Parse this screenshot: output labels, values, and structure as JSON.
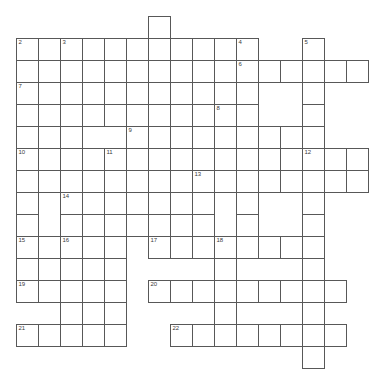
{
  "puzzle": {
    "title": "Crossword Grid",
    "kind": "crossword-grid",
    "geometry": {
      "origin_x": 16,
      "origin_y": 16,
      "cell_size": 22,
      "columns": 17,
      "rows": 17,
      "cell_border_color": "#585858",
      "cell_fill_color": "#ffffff",
      "number_color": "#3a3a3a",
      "background_color": "#ffffff",
      "width": 387,
      "height": 385
    },
    "entries": [
      {
        "number": "1",
        "direction": "down",
        "col": 6,
        "row": 0,
        "length": 1
      },
      {
        "number": "2",
        "direction": "across",
        "col": 0,
        "row": 1,
        "length": 10
      },
      {
        "number": "3",
        "direction": "down",
        "col": 2,
        "row": 1,
        "length": 1
      },
      {
        "number": "4",
        "direction": "down",
        "col": 10,
        "row": 1,
        "length": 1
      },
      {
        "number": "5",
        "direction": "down",
        "col": 13,
        "row": 1,
        "length": 1
      },
      {
        "number": "6",
        "direction": "across",
        "col": 10,
        "row": 2,
        "length": 6
      },
      {
        "number": "7",
        "direction": "across",
        "col": 0,
        "row": 3,
        "length": 9
      },
      {
        "number": "8",
        "direction": "down",
        "col": 9,
        "row": 4,
        "length": 1
      },
      {
        "number": "9",
        "direction": "across",
        "col": 5,
        "row": 5,
        "length": 9
      },
      {
        "number": "10",
        "direction": "across",
        "col": 0,
        "row": 6,
        "length": 17
      },
      {
        "number": "11",
        "direction": "down",
        "col": 4,
        "row": 6,
        "length": 1
      },
      {
        "number": "12",
        "direction": "across",
        "col": 13,
        "row": 6,
        "length": 3
      },
      {
        "number": "13",
        "direction": "across",
        "col": 8,
        "row": 7,
        "length": 9
      },
      {
        "number": "14",
        "direction": "across",
        "col": 2,
        "row": 8,
        "length": 8
      },
      {
        "number": "15",
        "direction": "across",
        "col": 0,
        "row": 10,
        "length": 5
      },
      {
        "number": "16",
        "direction": "down",
        "col": 2,
        "row": 10,
        "length": 1
      },
      {
        "number": "17",
        "direction": "across",
        "col": 6,
        "row": 10,
        "length": 8
      },
      {
        "number": "18",
        "direction": "down",
        "col": 9,
        "row": 10,
        "length": 1
      },
      {
        "number": "19",
        "direction": "across",
        "col": 0,
        "row": 12,
        "length": 5
      },
      {
        "number": "20",
        "direction": "across",
        "col": 6,
        "row": 12,
        "length": 9
      },
      {
        "number": "21",
        "direction": "across",
        "col": 0,
        "row": 14,
        "length": 5
      },
      {
        "number": "22",
        "direction": "across",
        "col": 7,
        "row": 14,
        "length": 8
      }
    ],
    "cells": [
      {
        "col": 6,
        "row": 0
      },
      {
        "col": 0,
        "row": 1,
        "number": "2"
      },
      {
        "col": 1,
        "row": 1
      },
      {
        "col": 2,
        "row": 1,
        "number": "3"
      },
      {
        "col": 3,
        "row": 1
      },
      {
        "col": 4,
        "row": 1
      },
      {
        "col": 5,
        "row": 1
      },
      {
        "col": 6,
        "row": 1
      },
      {
        "col": 7,
        "row": 1
      },
      {
        "col": 8,
        "row": 1
      },
      {
        "col": 9,
        "row": 1
      },
      {
        "col": 10,
        "row": 1,
        "number": "4"
      },
      {
        "col": 13,
        "row": 1,
        "number": "5"
      },
      {
        "col": 0,
        "row": 2
      },
      {
        "col": 1,
        "row": 2
      },
      {
        "col": 2,
        "row": 2
      },
      {
        "col": 3,
        "row": 2
      },
      {
        "col": 4,
        "row": 2
      },
      {
        "col": 5,
        "row": 2
      },
      {
        "col": 6,
        "row": 2
      },
      {
        "col": 7,
        "row": 2
      },
      {
        "col": 8,
        "row": 2
      },
      {
        "col": 9,
        "row": 2
      },
      {
        "col": 10,
        "row": 2,
        "number": "6"
      },
      {
        "col": 11,
        "row": 2
      },
      {
        "col": 12,
        "row": 2
      },
      {
        "col": 13,
        "row": 2
      },
      {
        "col": 14,
        "row": 2
      },
      {
        "col": 15,
        "row": 2
      },
      {
        "col": 0,
        "row": 3,
        "number": "7"
      },
      {
        "col": 1,
        "row": 3
      },
      {
        "col": 2,
        "row": 3
      },
      {
        "col": 3,
        "row": 3
      },
      {
        "col": 4,
        "row": 3
      },
      {
        "col": 5,
        "row": 3
      },
      {
        "col": 6,
        "row": 3
      },
      {
        "col": 7,
        "row": 3
      },
      {
        "col": 8,
        "row": 3
      },
      {
        "col": 10,
        "row": 3
      },
      {
        "col": 13,
        "row": 3
      },
      {
        "col": 0,
        "row": 4
      },
      {
        "col": 1,
        "row": 4
      },
      {
        "col": 2,
        "row": 4
      },
      {
        "col": 3,
        "row": 4
      },
      {
        "col": 4,
        "row": 4
      },
      {
        "col": 5,
        "row": 4
      },
      {
        "col": 6,
        "row": 4
      },
      {
        "col": 7,
        "row": 4
      },
      {
        "col": 8,
        "row": 4
      },
      {
        "col": 9,
        "row": 4,
        "number": "8"
      },
      {
        "col": 10,
        "row": 4
      },
      {
        "col": 13,
        "row": 4
      },
      {
        "col": 0,
        "row": 5
      },
      {
        "col": 1,
        "row": 5
      },
      {
        "col": 2,
        "row": 5
      },
      {
        "col": 5,
        "row": 5,
        "number": "9"
      },
      {
        "col": 6,
        "row": 5
      },
      {
        "col": 7,
        "row": 5
      },
      {
        "col": 8,
        "row": 5
      },
      {
        "col": 9,
        "row": 5
      },
      {
        "col": 10,
        "row": 5
      },
      {
        "col": 11,
        "row": 5
      },
      {
        "col": 12,
        "row": 5
      },
      {
        "col": 13,
        "row": 5
      },
      {
        "col": 0,
        "row": 6,
        "number": "10"
      },
      {
        "col": 1,
        "row": 6
      },
      {
        "col": 2,
        "row": 6
      },
      {
        "col": 3,
        "row": 6
      },
      {
        "col": 4,
        "row": 6,
        "number": "11"
      },
      {
        "col": 5,
        "row": 6
      },
      {
        "col": 6,
        "row": 6
      },
      {
        "col": 7,
        "row": 6
      },
      {
        "col": 8,
        "row": 6
      },
      {
        "col": 9,
        "row": 6
      },
      {
        "col": 10,
        "row": 6
      },
      {
        "col": 11,
        "row": 6
      },
      {
        "col": 12,
        "row": 6
      },
      {
        "col": 13,
        "row": 6,
        "number": "12"
      },
      {
        "col": 14,
        "row": 6
      },
      {
        "col": 15,
        "row": 6
      },
      {
        "col": 0,
        "row": 7
      },
      {
        "col": 1,
        "row": 7
      },
      {
        "col": 2,
        "row": 7
      },
      {
        "col": 3,
        "row": 7
      },
      {
        "col": 4,
        "row": 7
      },
      {
        "col": 6,
        "row": 7
      },
      {
        "col": 8,
        "row": 7,
        "number": "13"
      },
      {
        "col": 9,
        "row": 7
      },
      {
        "col": 10,
        "row": 7
      },
      {
        "col": 11,
        "row": 7
      },
      {
        "col": 12,
        "row": 7
      },
      {
        "col": 13,
        "row": 7
      },
      {
        "col": 14,
        "row": 7
      },
      {
        "col": 15,
        "row": 7
      },
      {
        "col": 0,
        "row": 8
      },
      {
        "col": 2,
        "row": 8,
        "number": "14"
      },
      {
        "col": 3,
        "row": 8
      },
      {
        "col": 4,
        "row": 8
      },
      {
        "col": 5,
        "row": 8
      },
      {
        "col": 6,
        "row": 8
      },
      {
        "col": 7,
        "row": 8
      },
      {
        "col": 8,
        "row": 8
      },
      {
        "col": 10,
        "row": 8
      },
      {
        "col": 13,
        "row": 8
      },
      {
        "col": 0,
        "row": 9
      },
      {
        "col": 2,
        "row": 9
      },
      {
        "col": 3,
        "row": 9
      },
      {
        "col": 4,
        "row": 9
      },
      {
        "col": 5,
        "row": 9
      },
      {
        "col": 6,
        "row": 9
      },
      {
        "col": 7,
        "row": 9
      },
      {
        "col": 8,
        "row": 9
      },
      {
        "col": 10,
        "row": 9
      },
      {
        "col": 13,
        "row": 9
      },
      {
        "col": 0,
        "row": 10,
        "number": "15"
      },
      {
        "col": 1,
        "row": 10
      },
      {
        "col": 2,
        "row": 10,
        "number": "16"
      },
      {
        "col": 3,
        "row": 10
      },
      {
        "col": 4,
        "row": 10
      },
      {
        "col": 6,
        "row": 10,
        "number": "17"
      },
      {
        "col": 7,
        "row": 10
      },
      {
        "col": 8,
        "row": 10
      },
      {
        "col": 9,
        "row": 10,
        "number": "18"
      },
      {
        "col": 10,
        "row": 10
      },
      {
        "col": 11,
        "row": 10
      },
      {
        "col": 12,
        "row": 10
      },
      {
        "col": 13,
        "row": 10
      },
      {
        "col": 0,
        "row": 11
      },
      {
        "col": 1,
        "row": 11
      },
      {
        "col": 2,
        "row": 11
      },
      {
        "col": 3,
        "row": 11
      },
      {
        "col": 4,
        "row": 11
      },
      {
        "col": 9,
        "row": 11
      },
      {
        "col": 13,
        "row": 11
      },
      {
        "col": 0,
        "row": 12,
        "number": "19"
      },
      {
        "col": 1,
        "row": 12
      },
      {
        "col": 2,
        "row": 12
      },
      {
        "col": 3,
        "row": 12
      },
      {
        "col": 4,
        "row": 12
      },
      {
        "col": 6,
        "row": 12,
        "number": "20"
      },
      {
        "col": 7,
        "row": 12
      },
      {
        "col": 8,
        "row": 12
      },
      {
        "col": 9,
        "row": 12
      },
      {
        "col": 10,
        "row": 12
      },
      {
        "col": 11,
        "row": 12
      },
      {
        "col": 12,
        "row": 12
      },
      {
        "col": 13,
        "row": 12
      },
      {
        "col": 14,
        "row": 12
      },
      {
        "col": 2,
        "row": 13
      },
      {
        "col": 3,
        "row": 13
      },
      {
        "col": 4,
        "row": 13
      },
      {
        "col": 9,
        "row": 13
      },
      {
        "col": 13,
        "row": 13
      },
      {
        "col": 0,
        "row": 14,
        "number": "21"
      },
      {
        "col": 1,
        "row": 14
      },
      {
        "col": 2,
        "row": 14
      },
      {
        "col": 3,
        "row": 14
      },
      {
        "col": 4,
        "row": 14
      },
      {
        "col": 7,
        "row": 14,
        "number": "22"
      },
      {
        "col": 8,
        "row": 14
      },
      {
        "col": 9,
        "row": 14
      },
      {
        "col": 10,
        "row": 14
      },
      {
        "col": 11,
        "row": 14
      },
      {
        "col": 12,
        "row": 14
      },
      {
        "col": 13,
        "row": 14
      },
      {
        "col": 14,
        "row": 14
      },
      {
        "col": 13,
        "row": 15
      }
    ]
  }
}
